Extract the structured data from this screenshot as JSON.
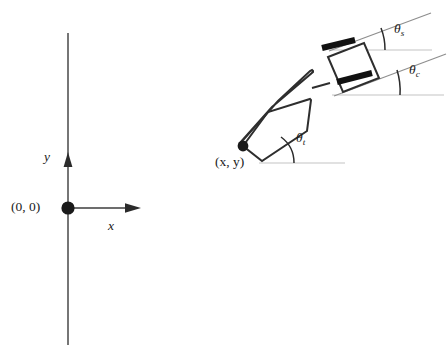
{
  "figure": {
    "type": "technical-diagram",
    "background_color": "#ffffff",
    "width": 448,
    "height": 364
  },
  "coordinate_frame": {
    "origin_label": "(0, 0)",
    "x_axis_label": "x",
    "y_axis_label": "y",
    "origin_px": {
      "x": 68,
      "y": 208
    },
    "axis_color": "#3c3c3c"
  },
  "vehicle": {
    "hitch_point_label": "(x, y)",
    "hitch_point_px": {
      "x": 243,
      "y": 146
    },
    "trailer": {
      "name": "trailer",
      "angle_label": "θ",
      "angle_subscript": "t",
      "angle_degrees": 41
    },
    "cab": {
      "name": "cab",
      "angle_label": "θ",
      "angle_subscript": "c",
      "angle_degrees": 20
    },
    "steering": {
      "name": "steering",
      "angle_label": "θ",
      "angle_subscript": "s",
      "angle_degrees": 20
    },
    "wheel_color": "#111111",
    "body_stroke_color": "#2e2e2e",
    "reference_line_color": "#c3c3c3"
  },
  "labels": {
    "origin": "(0, 0)",
    "x_axis": "x",
    "y_axis": "y",
    "hitch": "(x, y)",
    "theta": "θ",
    "theta_t_sub": "t",
    "theta_c_sub": "c",
    "theta_s_sub": "s"
  }
}
